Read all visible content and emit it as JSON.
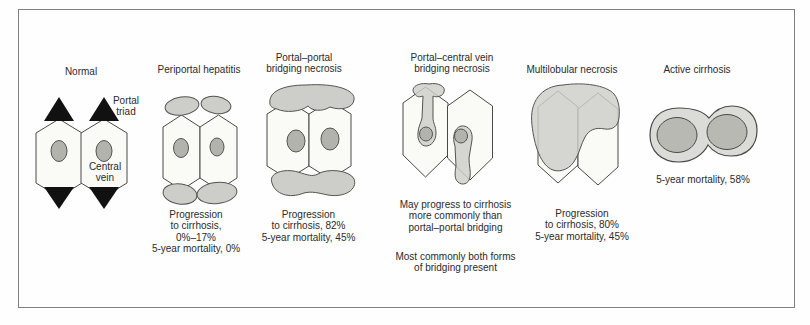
{
  "figure": {
    "type": "medical-diagram"
  },
  "colors": {
    "background": "#fefefe",
    "frame_border": "#7f7f7f",
    "lobule_fill": "#fafaf7",
    "outline": "#4a4a45",
    "necrosis_gray": "#cdcdc9",
    "central_vein_gray": "#b3b3ae",
    "nodule_gray": "#b9b9b4",
    "cirrhosis_fill": "#dbdbd7",
    "portal_triad_black": "#111111",
    "text": "#2b2b2b"
  },
  "panels": [
    {
      "id": "normal",
      "title": "Normal",
      "labels": {
        "portal_triad": [
          "Portal",
          "triad"
        ],
        "central_vein": [
          "Central",
          "vein"
        ]
      }
    },
    {
      "id": "periportal-hepatitis",
      "title": "Periportal hepatitis",
      "caption": [
        "Progression",
        "to cirrhosis,",
        "0%–17%",
        "5-year mortality, 0%"
      ]
    },
    {
      "id": "portal-portal-bridging-necrosis",
      "title": [
        "Portal–portal",
        "bridging necrosis"
      ],
      "caption": [
        "Progression",
        "to cirrhosis,  82%",
        "5-year mortality, 45%"
      ]
    },
    {
      "id": "portal-central-vein-bridging-necrosis",
      "title": [
        "Portal–central vein",
        "bridging necrosis"
      ],
      "caption": [
        "May progress to cirrhosis",
        "more commonly than",
        "portal–portal bridging"
      ],
      "caption2": [
        "Most commonly both forms",
        "of bridging present"
      ]
    },
    {
      "id": "multilobular-necrosis",
      "title": "Multilobular necrosis",
      "caption": [
        "Progression",
        "to cirrhosis, 80%",
        "5-year mortality, 45%"
      ]
    },
    {
      "id": "active-cirrhosis",
      "title": "Active cirrhosis",
      "caption": [
        "5-year mortality, 58%"
      ]
    }
  ]
}
